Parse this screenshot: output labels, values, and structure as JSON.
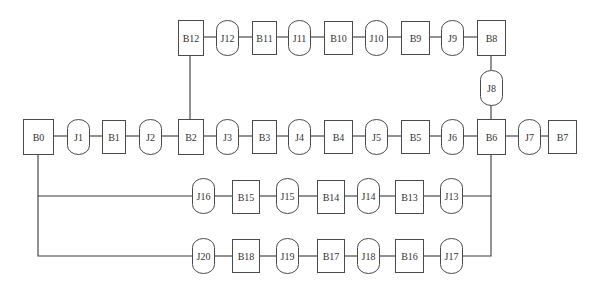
{
  "diagram": {
    "title": "",
    "colors": {
      "stroke": "#3a3a3a",
      "node_border": "#4a4a4a",
      "text": "#333333",
      "background": "#ffffff"
    },
    "node_types": {
      "B": "rectangle",
      "J": "rounded-capsule"
    },
    "nodes": [
      {
        "id": "B0",
        "type": "B",
        "x": 23,
        "y": 119,
        "w": 30,
        "h": 35
      },
      {
        "id": "J1",
        "type": "J",
        "x": 67,
        "y": 119,
        "w": 22,
        "h": 35
      },
      {
        "id": "B1",
        "type": "B",
        "x": 102,
        "y": 120,
        "w": 23,
        "h": 33
      },
      {
        "id": "J2",
        "type": "J",
        "x": 139,
        "y": 119,
        "w": 22,
        "h": 35
      },
      {
        "id": "B2",
        "type": "B",
        "x": 178,
        "y": 119,
        "w": 25,
        "h": 35
      },
      {
        "id": "J3",
        "type": "J",
        "x": 216,
        "y": 119,
        "w": 22,
        "h": 35
      },
      {
        "id": "B3",
        "type": "B",
        "x": 252,
        "y": 120,
        "w": 24,
        "h": 33
      },
      {
        "id": "J4",
        "type": "J",
        "x": 288,
        "y": 119,
        "w": 22,
        "h": 35
      },
      {
        "id": "B4",
        "type": "B",
        "x": 324,
        "y": 120,
        "w": 28,
        "h": 33
      },
      {
        "id": "J5",
        "type": "J",
        "x": 365,
        "y": 119,
        "w": 22,
        "h": 35
      },
      {
        "id": "B5",
        "type": "B",
        "x": 401,
        "y": 120,
        "w": 28,
        "h": 33
      },
      {
        "id": "J6",
        "type": "J",
        "x": 441,
        "y": 119,
        "w": 22,
        "h": 35
      },
      {
        "id": "B6",
        "type": "B",
        "x": 477,
        "y": 119,
        "w": 28,
        "h": 35
      },
      {
        "id": "J7",
        "type": "J",
        "x": 518,
        "y": 119,
        "w": 22,
        "h": 35
      },
      {
        "id": "B7",
        "type": "B",
        "x": 548,
        "y": 120,
        "w": 28,
        "h": 33
      },
      {
        "id": "B8",
        "type": "B",
        "x": 477,
        "y": 20,
        "w": 28,
        "h": 35
      },
      {
        "id": "J8",
        "type": "J",
        "x": 480,
        "y": 70,
        "w": 22,
        "h": 35
      },
      {
        "id": "J9",
        "type": "J",
        "x": 441,
        "y": 20,
        "w": 22,
        "h": 35
      },
      {
        "id": "B9",
        "type": "B",
        "x": 401,
        "y": 21,
        "w": 28,
        "h": 33
      },
      {
        "id": "J10",
        "type": "J",
        "x": 365,
        "y": 20,
        "w": 22,
        "h": 35
      },
      {
        "id": "B10",
        "type": "B",
        "x": 324,
        "y": 21,
        "w": 28,
        "h": 33
      },
      {
        "id": "J11",
        "type": "J",
        "x": 288,
        "y": 20,
        "w": 22,
        "h": 35
      },
      {
        "id": "B11",
        "type": "B",
        "x": 252,
        "y": 21,
        "w": 24,
        "h": 33
      },
      {
        "id": "J12",
        "type": "J",
        "x": 216,
        "y": 20,
        "w": 22,
        "h": 35
      },
      {
        "id": "B12",
        "type": "B",
        "x": 178,
        "y": 20,
        "w": 25,
        "h": 35
      },
      {
        "id": "J13",
        "type": "J",
        "x": 440,
        "y": 178,
        "w": 22,
        "h": 35
      },
      {
        "id": "B13",
        "type": "B",
        "x": 395,
        "y": 180,
        "w": 28,
        "h": 33
      },
      {
        "id": "J14",
        "type": "J",
        "x": 357,
        "y": 178,
        "w": 22,
        "h": 35
      },
      {
        "id": "B14",
        "type": "B",
        "x": 317,
        "y": 180,
        "w": 27,
        "h": 33
      },
      {
        "id": "J15",
        "type": "J",
        "x": 276,
        "y": 178,
        "w": 22,
        "h": 35
      },
      {
        "id": "B15",
        "type": "B",
        "x": 232,
        "y": 180,
        "w": 27,
        "h": 33
      },
      {
        "id": "J16",
        "type": "J",
        "x": 192,
        "y": 178,
        "w": 22,
        "h": 35
      },
      {
        "id": "J17",
        "type": "J",
        "x": 440,
        "y": 238,
        "w": 22,
        "h": 35
      },
      {
        "id": "B16",
        "type": "B",
        "x": 395,
        "y": 239,
        "w": 28,
        "h": 33
      },
      {
        "id": "J18",
        "type": "J",
        "x": 357,
        "y": 238,
        "w": 22,
        "h": 35
      },
      {
        "id": "B17",
        "type": "B",
        "x": 317,
        "y": 239,
        "w": 27,
        "h": 33
      },
      {
        "id": "J19",
        "type": "J",
        "x": 276,
        "y": 238,
        "w": 22,
        "h": 35
      },
      {
        "id": "B18",
        "type": "B",
        "x": 232,
        "y": 239,
        "w": 27,
        "h": 33
      },
      {
        "id": "J20",
        "type": "J",
        "x": 192,
        "y": 238,
        "w": 22,
        "h": 35
      }
    ],
    "edges": [
      {
        "from": "B0",
        "to": "J1",
        "points": [
          [
            53,
            136
          ],
          [
            67,
            136
          ]
        ]
      },
      {
        "from": "J1",
        "to": "B1",
        "points": [
          [
            89,
            136
          ],
          [
            102,
            136
          ]
        ]
      },
      {
        "from": "B1",
        "to": "J2",
        "points": [
          [
            125,
            136
          ],
          [
            139,
            136
          ]
        ]
      },
      {
        "from": "J2",
        "to": "B2",
        "points": [
          [
            161,
            136
          ],
          [
            178,
            136
          ]
        ]
      },
      {
        "from": "B2",
        "to": "J3",
        "points": [
          [
            203,
            136
          ],
          [
            216,
            136
          ]
        ]
      },
      {
        "from": "J3",
        "to": "B3",
        "points": [
          [
            238,
            136
          ],
          [
            252,
            136
          ]
        ]
      },
      {
        "from": "B3",
        "to": "J4",
        "points": [
          [
            276,
            136
          ],
          [
            288,
            136
          ]
        ]
      },
      {
        "from": "J4",
        "to": "B4",
        "points": [
          [
            310,
            136
          ],
          [
            324,
            136
          ]
        ]
      },
      {
        "from": "B4",
        "to": "J5",
        "points": [
          [
            352,
            136
          ],
          [
            365,
            136
          ]
        ]
      },
      {
        "from": "J5",
        "to": "B5",
        "points": [
          [
            387,
            136
          ],
          [
            401,
            136
          ]
        ]
      },
      {
        "from": "B5",
        "to": "J6",
        "points": [
          [
            429,
            136
          ],
          [
            441,
            136
          ]
        ]
      },
      {
        "from": "J6",
        "to": "B6",
        "points": [
          [
            463,
            136
          ],
          [
            477,
            136
          ]
        ]
      },
      {
        "from": "B6",
        "to": "J7",
        "points": [
          [
            505,
            136
          ],
          [
            518,
            136
          ]
        ]
      },
      {
        "from": "J7",
        "to": "B7",
        "points": [
          [
            540,
            136
          ],
          [
            548,
            136
          ]
        ]
      },
      {
        "from": "B2",
        "to": "B12",
        "points": [
          [
            190,
            119
          ],
          [
            190,
            55
          ]
        ]
      },
      {
        "from": "B12",
        "to": "J12",
        "points": [
          [
            203,
            37
          ],
          [
            216,
            37
          ]
        ]
      },
      {
        "from": "J12",
        "to": "B11",
        "points": [
          [
            238,
            37
          ],
          [
            252,
            37
          ]
        ]
      },
      {
        "from": "B11",
        "to": "J11",
        "points": [
          [
            276,
            37
          ],
          [
            288,
            37
          ]
        ]
      },
      {
        "from": "J11",
        "to": "B10",
        "points": [
          [
            310,
            37
          ],
          [
            324,
            37
          ]
        ]
      },
      {
        "from": "B10",
        "to": "J10",
        "points": [
          [
            352,
            37
          ],
          [
            365,
            37
          ]
        ]
      },
      {
        "from": "J10",
        "to": "B9",
        "points": [
          [
            387,
            37
          ],
          [
            401,
            37
          ]
        ]
      },
      {
        "from": "B9",
        "to": "J9",
        "points": [
          [
            429,
            37
          ],
          [
            441,
            37
          ]
        ]
      },
      {
        "from": "J9",
        "to": "B8",
        "points": [
          [
            463,
            37
          ],
          [
            477,
            37
          ]
        ]
      },
      {
        "from": "B8",
        "to": "J8",
        "points": [
          [
            491,
            55
          ],
          [
            491,
            70
          ]
        ]
      },
      {
        "from": "J8",
        "to": "B6",
        "points": [
          [
            491,
            105
          ],
          [
            491,
            119
          ]
        ]
      },
      {
        "from": "B0",
        "to": "J16",
        "points": [
          [
            38,
            154
          ],
          [
            38,
            196
          ],
          [
            192,
            196
          ]
        ]
      },
      {
        "from": "J16",
        "to": "B15",
        "points": [
          [
            214,
            196
          ],
          [
            232,
            196
          ]
        ]
      },
      {
        "from": "B15",
        "to": "J15",
        "points": [
          [
            259,
            196
          ],
          [
            276,
            196
          ]
        ]
      },
      {
        "from": "J15",
        "to": "B14",
        "points": [
          [
            298,
            196
          ],
          [
            317,
            196
          ]
        ]
      },
      {
        "from": "B14",
        "to": "J14",
        "points": [
          [
            344,
            196
          ],
          [
            357,
            196
          ]
        ]
      },
      {
        "from": "J14",
        "to": "B13",
        "points": [
          [
            379,
            196
          ],
          [
            395,
            196
          ]
        ]
      },
      {
        "from": "B13",
        "to": "J13",
        "points": [
          [
            423,
            196
          ],
          [
            440,
            196
          ]
        ]
      },
      {
        "from": "J13",
        "to": "B6",
        "points": [
          [
            462,
            196
          ],
          [
            491,
            196
          ],
          [
            491,
            154
          ]
        ]
      },
      {
        "from": "B0",
        "to": "J20",
        "points": [
          [
            38,
            196
          ],
          [
            38,
            256
          ],
          [
            192,
            256
          ]
        ]
      },
      {
        "from": "J20",
        "to": "B18",
        "points": [
          [
            214,
            256
          ],
          [
            232,
            256
          ]
        ]
      },
      {
        "from": "B18",
        "to": "J19",
        "points": [
          [
            259,
            256
          ],
          [
            276,
            256
          ]
        ]
      },
      {
        "from": "J19",
        "to": "B17",
        "points": [
          [
            298,
            256
          ],
          [
            317,
            256
          ]
        ]
      },
      {
        "from": "B17",
        "to": "J18",
        "points": [
          [
            344,
            256
          ],
          [
            357,
            256
          ]
        ]
      },
      {
        "from": "J18",
        "to": "B16",
        "points": [
          [
            379,
            256
          ],
          [
            395,
            256
          ]
        ]
      },
      {
        "from": "B16",
        "to": "J17",
        "points": [
          [
            423,
            256
          ],
          [
            440,
            256
          ]
        ]
      },
      {
        "from": "J17",
        "to": "B6",
        "points": [
          [
            462,
            256
          ],
          [
            491,
            256
          ],
          [
            491,
            196
          ]
        ]
      }
    ]
  }
}
